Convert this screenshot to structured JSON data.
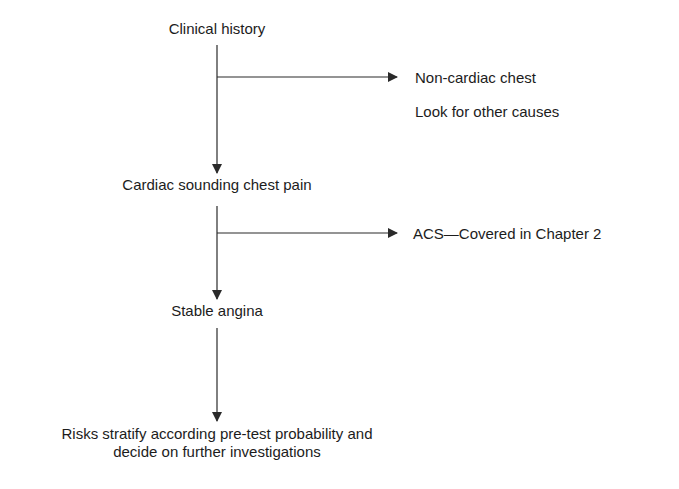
{
  "flowchart": {
    "nodes": {
      "clinical_history": "Clinical history",
      "non_cardiac_title": "Non-cardiac chest",
      "non_cardiac_action": "Look for other causes",
      "cardiac_pain": "Cardiac sounding chest pain",
      "acs": "ACS—Covered in Chapter 2",
      "stable_angina": "Stable angina",
      "risk_line1": "Risks stratify according pre-test probability and",
      "risk_line2": "decide on further investigations"
    },
    "edges": [
      {
        "from": "Clinical history",
        "to": "Cardiac sounding chest pain"
      },
      {
        "from": "Clinical history",
        "to": "Non-cardiac chest"
      },
      {
        "from": "Cardiac sounding chest pain",
        "to": "Stable angina"
      },
      {
        "from": "Cardiac sounding chest pain",
        "to": "ACS—Covered in Chapter 2"
      },
      {
        "from": "Stable angina",
        "to": "Risks stratify according pre-test probability and decide on further investigations"
      }
    ],
    "colors": {
      "line": "#2a2a2a",
      "text": "#1c1c1c",
      "background": "#ffffff"
    }
  }
}
